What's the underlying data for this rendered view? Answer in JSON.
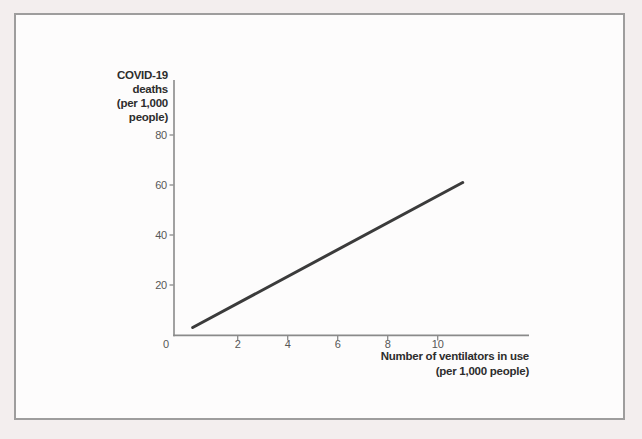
{
  "page": {
    "background_color": "#f3eeee",
    "panel_background_color": "#fdfcfc",
    "panel_border_color": "#9e9d9d"
  },
  "chart_data": {
    "type": "line",
    "title": "",
    "ylabel": "COVID-19 deaths (per 1,000 people)",
    "ylabel_lines": [
      "COVID-19",
      "deaths",
      "(per 1,000",
      "people)"
    ],
    "xlabel": "Number of ventilators in use (per 1,000 people)",
    "xlabel_lines": [
      "Number of ventilators in use",
      "(per 1,000 people)"
    ],
    "y_ticks": [
      80,
      60,
      40,
      20
    ],
    "x_ticks": [
      2,
      4,
      6,
      8,
      10
    ],
    "origin_label": "0",
    "xlim_shown": [
      0,
      12.8
    ],
    "ylim_shown": [
      0,
      102
    ],
    "grid": false,
    "legend": "none",
    "series": [
      {
        "name": "COVID-19 deaths vs ventilators in use (straight upward-sloping line)",
        "x": [
          0.2,
          11
        ],
        "y": [
          3,
          61
        ]
      }
    ],
    "line_color": "#3b3b3b",
    "line_width": 3,
    "axis_color": "#8a8a8a",
    "tick_label_color": "#575757",
    "axis_title_color": "#2d2d2d"
  }
}
